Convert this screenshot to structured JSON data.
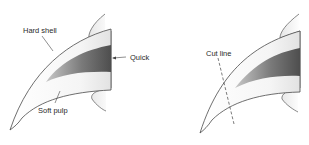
{
  "diagram": {
    "type": "claw-anatomy",
    "panels": [
      {
        "id": "anatomy",
        "labels": {
          "hard_shell": "Hard shell",
          "quick": "Quick",
          "soft_pulp": "Soft pulp"
        }
      },
      {
        "id": "cutting",
        "labels": {
          "cut_line": "Cut line"
        }
      }
    ],
    "colors": {
      "outline": "#4a4a4a",
      "quick_dark": "#555555",
      "quick_light": "#bdbdbd",
      "shell_fill": "#f4f4f4",
      "base_shadow": "#dcdcdc",
      "text": "#2a2a2a"
    }
  }
}
